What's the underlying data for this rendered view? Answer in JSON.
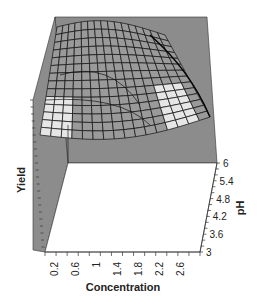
{
  "chart_data": {
    "type": "surface3d",
    "title": "",
    "xlabel": "Concentration",
    "ylabel": "pH",
    "zlabel": "Yield",
    "x_ticks": [
      "0.2",
      "0.6",
      "1",
      "1.4",
      "1.8",
      "2.2",
      "2.6"
    ],
    "y_ticks": [
      "3",
      "3.6",
      "4.2",
      "4.8",
      "5.4",
      "6"
    ],
    "xlim": [
      0,
      3
    ],
    "ylim": [
      3,
      6
    ],
    "z_ticks_labeled": false,
    "grid": false,
    "legend": "none",
    "colors": {
      "wall": "#8c8c8c",
      "floor": "#ffffff",
      "mesh_line": "#111111",
      "mesh_fill": "#9a9a9a",
      "highlight_fill": "#e6e6e6"
    }
  }
}
